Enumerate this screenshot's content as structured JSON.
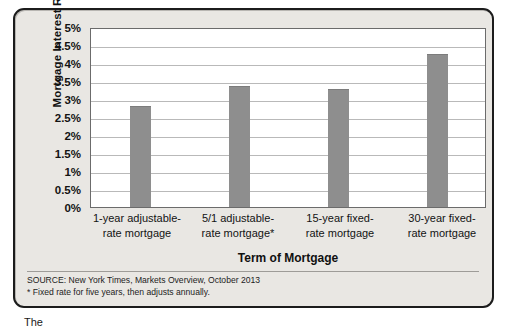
{
  "chart_data": {
    "type": "bar",
    "title": "",
    "xlabel": "Term of Mortgage",
    "ylabel": "Mortgage Interest Rate",
    "categories": [
      "1-year adjustable-\nrate mortgage",
      "5/1 adjustable-\nrate mortgage*",
      "15-year fixed-\nrate mortgage",
      "30-year fixed-\nrate mortgage"
    ],
    "values": [
      2.8,
      3.35,
      3.28,
      4.25
    ],
    "ylim": [
      0,
      5
    ],
    "ytick_values": [
      5,
      4.5,
      4,
      3.5,
      3,
      2.5,
      2,
      1.5,
      1,
      0.5,
      0
    ],
    "ytick_labels": [
      "5%",
      "4.5%",
      "4%",
      "3.5%",
      "3%",
      "2.5%",
      "2%",
      "1.5%",
      "1%",
      "0.5%",
      "0%"
    ],
    "grid": true,
    "legend": "none",
    "bar_color": "#8e8e8e",
    "plot_background": "#ffffff",
    "figure_background": "#e9e7e3"
  },
  "axes": {
    "y_title": "Mortgage Interest Rate",
    "x_title": "Term of Mortgage"
  },
  "x_labels": [
    {
      "line1": "1-year adjustable-",
      "line2": "rate mortgage"
    },
    {
      "line1": "5/1 adjustable-",
      "line2": "rate mortgage*"
    },
    {
      "line1": "15-year fixed-",
      "line2": "rate mortgage"
    },
    {
      "line1": "30-year fixed-",
      "line2": "rate mortgage"
    }
  ],
  "source": {
    "line1": "SOURCE: New York Times, Markets Overview, October 2013",
    "line2": "* Fixed rate for five years, then adjusts annually."
  },
  "caption": {
    "text": "The"
  }
}
